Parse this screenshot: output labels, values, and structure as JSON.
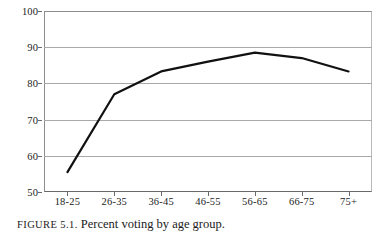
{
  "figure": {
    "caption_label": "FIGURE 5.1.",
    "caption_text": "Percent voting by age group."
  },
  "chart_data": {
    "type": "line",
    "title": "Percent voting by age group",
    "xlabel": "",
    "ylabel": "",
    "categories": [
      "18-25",
      "26-35",
      "36-45",
      "46-55",
      "56-65",
      "66-75",
      "75+"
    ],
    "values": [
      55.5,
      77,
      83.3,
      86,
      88.5,
      87,
      83.3
    ],
    "series": [
      {
        "name": "Percent voting",
        "values": [
          55.5,
          77,
          83.3,
          86,
          88.5,
          87,
          83.3
        ]
      }
    ],
    "ylim": [
      50,
      100
    ],
    "yticks": [
      50,
      60,
      70,
      80,
      90,
      100
    ],
    "ytick_labels": [
      "50",
      "60",
      "70",
      "80",
      "90",
      "100"
    ],
    "grid": true,
    "grid_axis": "y",
    "legend": false,
    "line_color": "#111111",
    "line_width": 2.2,
    "markers": false
  }
}
